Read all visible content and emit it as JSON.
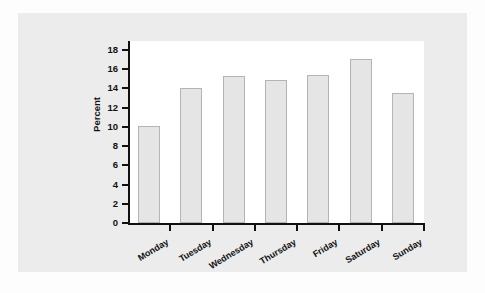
{
  "chart_data": {
    "type": "bar",
    "title": "",
    "subtitle": "",
    "xlabel": "",
    "ylabel": "Percent",
    "categories": [
      "Monday",
      "Tuesday",
      "Wednesday",
      "Thursday",
      "Friday",
      "Saturday",
      "Sunday"
    ],
    "values": [
      10.1,
      14.0,
      15.25,
      14.9,
      15.35,
      17.1,
      13.55
    ],
    "ylim": [
      0,
      18
    ],
    "ytick_labels": [
      "0",
      "2",
      "4",
      "6",
      "8",
      "10",
      "12",
      "14",
      "16",
      "18"
    ],
    "ytick_values": [
      0,
      2,
      4,
      6,
      8,
      10,
      12,
      14,
      16,
      18
    ],
    "grid": false,
    "legend": false,
    "legend_position": "none",
    "bar_fill_color": "#e5e5e5",
    "bar_border_color": "#b4b4b4",
    "axis_color": "#111111",
    "plot_background": "#ffffff",
    "panel_background": "#ececec"
  }
}
